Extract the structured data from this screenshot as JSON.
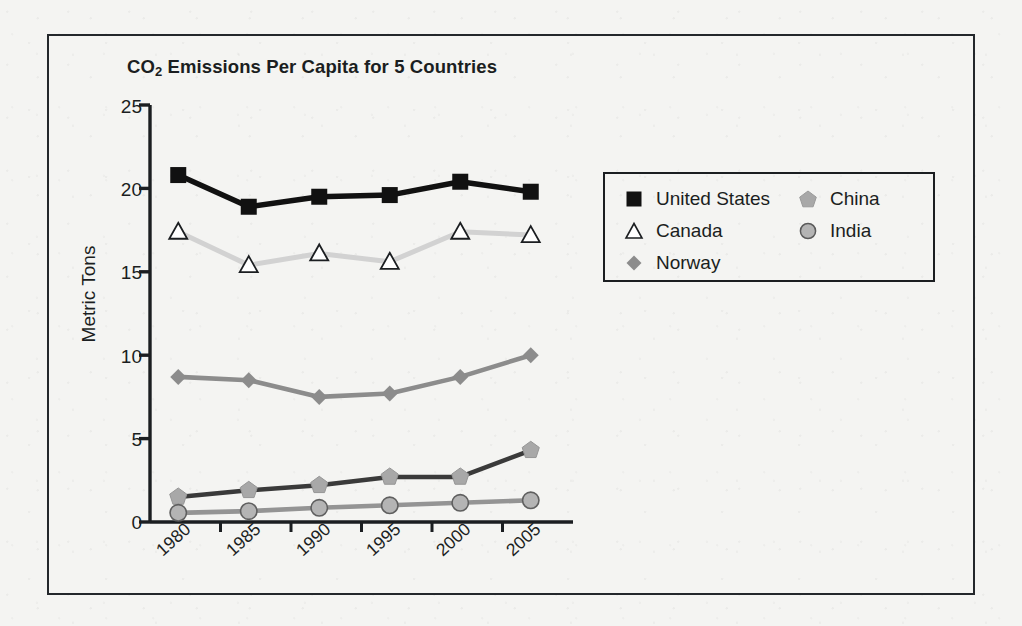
{
  "figure": {
    "title_main": "CO",
    "title_sub": "2",
    "title_rest": " Emissions Per Capita for 5 Countries"
  },
  "chart_data": {
    "type": "line",
    "title": "CO2 Emissions Per Capita for 5 Countries",
    "xlabel": "",
    "ylabel": "Metric Tons",
    "categories": [
      "1980",
      "1985",
      "1990",
      "1995",
      "2000",
      "2005"
    ],
    "ylim": [
      0,
      25
    ],
    "yticks": [
      0,
      5,
      10,
      15,
      20,
      25
    ],
    "grid": false,
    "legend_position": "right",
    "series": [
      {
        "name": "United States",
        "marker": "square",
        "marker_color": "#111111",
        "line_color": "#111111",
        "values": [
          20.8,
          18.9,
          19.5,
          19.6,
          20.4,
          19.8
        ]
      },
      {
        "name": "Canada",
        "marker": "triangle-open",
        "marker_color": "#ffffff",
        "line_color": "#d2d2d2",
        "values": [
          17.4,
          15.4,
          16.1,
          15.6,
          17.4,
          17.2
        ]
      },
      {
        "name": "Norway",
        "marker": "diamond",
        "marker_color": "#8c8c8c",
        "line_color": "#8c8c8c",
        "values": [
          8.7,
          8.5,
          7.5,
          7.7,
          8.7,
          10.0
        ]
      },
      {
        "name": "China",
        "marker": "pentagon",
        "marker_color": "#a8a8a8",
        "line_color": "#3a3a3a",
        "values": [
          1.5,
          1.9,
          2.2,
          2.7,
          2.7,
          4.3
        ]
      },
      {
        "name": "India",
        "marker": "circle",
        "marker_color": "#b4b4b4",
        "line_color": "#949494",
        "values": [
          0.55,
          0.65,
          0.85,
          1.0,
          1.15,
          1.3
        ]
      }
    ]
  },
  "y_axis": {
    "title": "Metric Tons",
    "ticks": [
      "25",
      "20",
      "15",
      "10",
      "5",
      "0"
    ]
  },
  "x_axis": {
    "ticks": [
      "1980",
      "1985",
      "1990",
      "1995",
      "2000",
      "2005"
    ]
  },
  "legend": {
    "entries": [
      {
        "label": "United States",
        "icon": "square-marker-icon"
      },
      {
        "label": "Canada",
        "icon": "triangle-outline-marker-icon"
      },
      {
        "label": "Norway",
        "icon": "diamond-marker-icon"
      },
      {
        "label": "China",
        "icon": "pentagon-marker-icon"
      },
      {
        "label": "India",
        "icon": "circle-marker-icon"
      }
    ]
  },
  "colors": {
    "frame": "#23272b",
    "axis": "#1b1e21",
    "page_background": "#f4f4f2"
  }
}
